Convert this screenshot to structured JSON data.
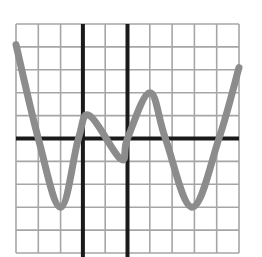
{
  "chart_data": {
    "type": "line",
    "title": "",
    "xlabel": "",
    "ylabel": "",
    "grid": true,
    "legend": null,
    "xlim": [
      -3,
      7
    ],
    "ylim": [
      -5,
      5
    ],
    "axes": {
      "horizontal_axis_y": 0,
      "vertical_thick_lines_x": [
        0,
        2
      ]
    },
    "series": [
      {
        "name": "curve",
        "color": "#8c8c8c",
        "x": [
          -3,
          -2,
          -1,
          -0.2,
          0.3,
          1.7,
          2,
          3,
          3.7,
          4.9,
          6.1,
          7
        ],
        "y": [
          4.1,
          0,
          -3,
          0,
          1,
          -0.9,
          0,
          2,
          0,
          -3,
          0,
          3.1
        ]
      }
    ]
  },
  "style": {
    "grid_color": "#a6a6a6",
    "axis_color": "#1a1a1a",
    "curve_color": "#8c8c8c",
    "background": "#ffffff"
  }
}
